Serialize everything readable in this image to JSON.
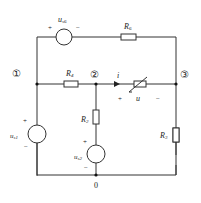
{
  "diagram": {
    "type": "circuit",
    "nodes": {
      "n1": "①",
      "n2": "②",
      "n3": "③",
      "n0": "0"
    },
    "components": {
      "us6": {
        "label": "u",
        "sub": "s6",
        "plus": "+",
        "minus": "−"
      },
      "R6": {
        "label": "R",
        "sub": "6"
      },
      "R4": {
        "label": "R",
        "sub": "4"
      },
      "R2": {
        "label": "R",
        "sub": "2"
      },
      "R3": {
        "label": "R",
        "sub": "3"
      },
      "us1": {
        "label": "u",
        "sub": "s1",
        "plus": "+",
        "minus": "−"
      },
      "us2": {
        "label": "u",
        "sub": "s2",
        "plus": "+",
        "minus": "−"
      },
      "nonlinear": {
        "current": "i",
        "voltage": "u",
        "plus": "+",
        "minus": "−"
      }
    }
  }
}
